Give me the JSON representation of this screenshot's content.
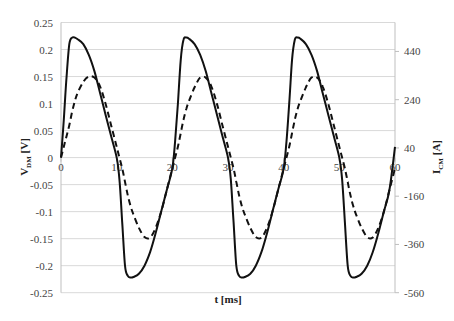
{
  "chart_data": {
    "type": "line",
    "title": "",
    "xlabel": "t [ms]",
    "ylabel": "V_DM [V]",
    "ylabel_main": "V",
    "ylabel_sub": "DM",
    "ylabel_unit": " [V]",
    "y2label": "I_CM [A]",
    "y2label_main": "I",
    "y2label_sub": "CM",
    "y2label_unit": " [A]",
    "xlim": [
      0,
      60
    ],
    "ylim": [
      -0.25,
      0.25
    ],
    "y2lim": [
      -560,
      560
    ],
    "grid": true,
    "legend": "none",
    "x_ticks": [
      0,
      10,
      20,
      30,
      40,
      50,
      60
    ],
    "y_ticks": [
      0.25,
      0.2,
      0.15,
      0.1,
      0.05,
      0,
      -0.05,
      -0.1,
      -0.15,
      -0.2,
      -0.25
    ],
    "y2_ticks": [
      440,
      240,
      40,
      -160,
      -360,
      -560
    ],
    "x": [
      0,
      0.5,
      1,
      1.5,
      2,
      2.5,
      3,
      4,
      5,
      6,
      7,
      8,
      9,
      10,
      10.5,
      11,
      11.5,
      12,
      12.5,
      13,
      14,
      15,
      16,
      17,
      18,
      19,
      20,
      20.5,
      21,
      21.5,
      22,
      22.5,
      23,
      24,
      25,
      26,
      27,
      28,
      29,
      30,
      30.5,
      31,
      31.5,
      32,
      32.5,
      33,
      34,
      35,
      36,
      37,
      38,
      39,
      40,
      40.5,
      41,
      41.5,
      42,
      42.5,
      43,
      44,
      45,
      46,
      47,
      48,
      49,
      50,
      50.5,
      51,
      51.5,
      52,
      52.5,
      53,
      54,
      55,
      56,
      57,
      58,
      59,
      60
    ],
    "series": [
      {
        "name": "V_DM",
        "axis": "left",
        "style": "solid",
        "values": [
          0,
          0.07,
          0.15,
          0.21,
          0.222,
          0.222,
          0.219,
          0.21,
          0.19,
          0.16,
          0.12,
          0.08,
          0.04,
          0.0,
          -0.04,
          -0.12,
          -0.2,
          -0.219,
          -0.222,
          -0.221,
          -0.215,
          -0.2,
          -0.175,
          -0.14,
          -0.1,
          -0.06,
          -0.02,
          0.03,
          0.1,
          0.18,
          0.218,
          0.222,
          0.22,
          0.21,
          0.19,
          0.16,
          0.12,
          0.08,
          0.04,
          0.0,
          -0.04,
          -0.12,
          -0.2,
          -0.219,
          -0.222,
          -0.221,
          -0.215,
          -0.2,
          -0.175,
          -0.14,
          -0.1,
          -0.06,
          -0.02,
          0.03,
          0.1,
          0.18,
          0.218,
          0.222,
          0.22,
          0.21,
          0.19,
          0.16,
          0.12,
          0.08,
          0.04,
          0.0,
          -0.04,
          -0.12,
          -0.2,
          -0.219,
          -0.222,
          -0.221,
          -0.215,
          -0.2,
          -0.175,
          -0.14,
          -0.1,
          -0.06,
          0.02
        ]
      },
      {
        "name": "I_CM",
        "axis": "left",
        "style": "dashed",
        "values": [
          0,
          0.02,
          0.04,
          0.06,
          0.085,
          0.105,
          0.12,
          0.14,
          0.15,
          0.148,
          0.132,
          0.1,
          0.06,
          0.02,
          0.0,
          -0.02,
          -0.045,
          -0.07,
          -0.09,
          -0.105,
          -0.13,
          -0.147,
          -0.148,
          -0.13,
          -0.1,
          -0.06,
          -0.02,
          0.0,
          0.02,
          0.045,
          0.07,
          0.09,
          0.105,
          0.13,
          0.148,
          0.148,
          0.132,
          0.1,
          0.06,
          0.02,
          0.0,
          -0.02,
          -0.045,
          -0.07,
          -0.09,
          -0.105,
          -0.13,
          -0.147,
          -0.148,
          -0.13,
          -0.1,
          -0.06,
          -0.02,
          0.0,
          0.02,
          0.045,
          0.07,
          0.09,
          0.105,
          0.13,
          0.148,
          0.148,
          0.132,
          0.1,
          0.06,
          0.02,
          0.0,
          -0.02,
          -0.045,
          -0.07,
          -0.09,
          -0.105,
          -0.13,
          -0.147,
          -0.148,
          -0.13,
          -0.1,
          -0.06,
          -0.02
        ]
      }
    ]
  },
  "colors": {
    "line": "#111111",
    "grid": "#d9d9d9",
    "axis": "#bfbfbf"
  }
}
